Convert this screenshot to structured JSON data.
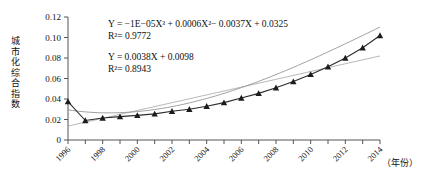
{
  "chart_data": {
    "type": "line",
    "title": "",
    "xlabel": "（年份）",
    "ylabel": "城市化综合指数",
    "ylim": [
      0,
      0.12
    ],
    "xlim": [
      1996,
      2014
    ],
    "grid": false,
    "legend": "none",
    "y_ticks": [
      "0",
      "0.02",
      "0.04",
      "0.06",
      "0.08",
      "0.10",
      "0.12"
    ],
    "y_tick_values": [
      0,
      0.02,
      0.04,
      0.06,
      0.08,
      0.1,
      0.12
    ],
    "x_tick_labels": [
      "1996",
      "1998",
      "2000",
      "2002",
      "2004",
      "2006",
      "2008",
      "2010",
      "2012",
      "2014"
    ],
    "x": [
      1996,
      1997,
      1998,
      1999,
      2000,
      2001,
      2002,
      2003,
      2004,
      2005,
      2006,
      2007,
      2008,
      2009,
      2010,
      2011,
      2012,
      2013,
      2014
    ],
    "series": [
      {
        "name": "城市化综合指数",
        "marker": "triangle",
        "values": [
          0.0375,
          0.019,
          0.0215,
          0.0228,
          0.024,
          0.0255,
          0.028,
          0.03,
          0.033,
          0.0365,
          0.041,
          0.0455,
          0.051,
          0.057,
          0.064,
          0.0715,
          0.08,
          0.09,
          0.102
        ]
      }
    ],
    "annotations": [
      {
        "id": "poly-fit",
        "equation": "Y = −1E−05X³ + 0.0006X²− 0.0037X + 0.0325",
        "r2": "R²= 0.9772"
      },
      {
        "id": "linear-fit",
        "equation": "Y = 0.0038X + 0.0098",
        "r2": "R²= 0.8943"
      }
    ],
    "trendlines": [
      {
        "name": "polynomial",
        "type": "cubic",
        "coefficients": [
          -1e-05,
          0.0006,
          -0.0037,
          0.0325
        ]
      },
      {
        "name": "linear",
        "type": "linear",
        "coefficients": [
          0.0038,
          0.0098
        ]
      }
    ],
    "colors": {
      "series": "#2b2b2b",
      "marker": "#1c1c1c",
      "trend_poly": "#8a8a8a",
      "trend_linear": "#a6a6a6",
      "axis": "#555555",
      "text": "#111111",
      "background": "#ffffff"
    }
  },
  "ylabel_chars": [
    "城",
    "市",
    "化",
    "综",
    "合",
    "指",
    "数"
  ]
}
